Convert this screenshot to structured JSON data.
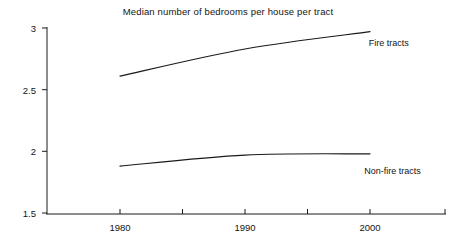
{
  "chart_data": {
    "type": "line",
    "title": "Median number of bedrooms per house per tract",
    "xlabel": "",
    "ylabel": "",
    "x": [
      1980,
      1990,
      2000
    ],
    "categories": [
      "1980",
      "1990",
      "2000"
    ],
    "xlim": [
      1975,
      2005
    ],
    "ylim": [
      1.5,
      3
    ],
    "yticks": [
      1.5,
      2,
      2.5,
      3
    ],
    "ytick_labels": [
      "1.5",
      "2",
      "2.5",
      "3"
    ],
    "xticks": [
      1980,
      1990,
      2000
    ],
    "xtick_labels": [
      "1980",
      "1990",
      "2000"
    ],
    "grid": false,
    "legend": "inline-annotations",
    "series": [
      {
        "name": "Fire tracts",
        "label": "Fire tracts",
        "color": "#1a1a1a",
        "values": [
          2.61,
          2.83,
          2.97
        ],
        "label_x": 2001.5,
        "label_y": 2.88
      },
      {
        "name": "Non-fire tracts",
        "label": "Non-fire tracts",
        "color": "#1a1a1a",
        "values": [
          1.88,
          1.97,
          1.98
        ],
        "label_x": 2001.8,
        "label_y": 1.84
      }
    ]
  },
  "axes": {
    "y_axis_name": "y-axis",
    "x_axis_name": "x-axis"
  }
}
